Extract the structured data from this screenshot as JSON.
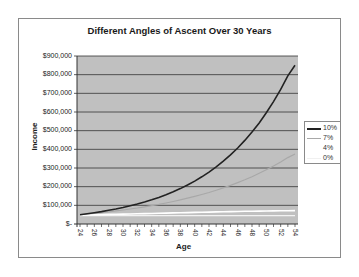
{
  "chart_data": {
    "type": "line",
    "title": "Different Angles of Ascent Over 30 Years",
    "xlabel": "Age",
    "ylabel": "Income",
    "ylim": [
      0,
      900000
    ],
    "xlim": [
      24,
      54
    ],
    "grid": true,
    "legend_position": "right",
    "y_tick_labels": [
      "$-",
      "$100,000",
      "$200,000",
      "$300,000",
      "$400,000",
      "$500,000",
      "$600,000",
      "$700,000",
      "$800,000",
      "$900,000"
    ],
    "x_tick_labels": [
      "24",
      "26",
      "28",
      "30",
      "32",
      "34",
      "36",
      "38",
      "40",
      "42",
      "44",
      "46",
      "48",
      "50",
      "52",
      "54"
    ],
    "x": [
      24,
      25,
      26,
      27,
      28,
      29,
      30,
      31,
      32,
      33,
      34,
      35,
      36,
      37,
      38,
      39,
      40,
      41,
      42,
      43,
      44,
      45,
      46,
      47,
      48,
      49,
      50,
      51,
      52,
      53,
      54
    ],
    "series": [
      {
        "name": "10%",
        "color": "#222222",
        "values": [
          50000,
          55000,
          60500,
          66550,
          73205,
          80526,
          88578,
          97436,
          107179,
          117897,
          129687,
          142656,
          156921,
          172614,
          189875,
          208862,
          229749,
          252724,
          277996,
          305795,
          336375,
          370012,
          407013,
          447715,
          492486,
          541735,
          595908,
          655499,
          721049,
          793154,
          850000
        ]
      },
      {
        "name": "7%",
        "color": "#a8a8a8",
        "values": [
          50000,
          53500,
          57245,
          61252,
          65540,
          70128,
          75036,
          80289,
          85909,
          91923,
          98358,
          105243,
          112610,
          120492,
          128927,
          137952,
          147608,
          157941,
          168997,
          180826,
          193484,
          207028,
          221520,
          237026,
          253618,
          271371,
          290367,
          310693,
          332441,
          355712,
          375000
        ]
      },
      {
        "name": "4%",
        "color": "#ffffff",
        "values": [
          48000,
          48800,
          49600,
          50400,
          51200,
          52000,
          52900,
          53800,
          54700,
          55600,
          56500,
          57400,
          58300,
          59200,
          60100,
          61000,
          61900,
          62800,
          63700,
          64600,
          65500,
          66300,
          67100,
          67800,
          68500,
          69200,
          69800,
          70400,
          71000,
          71500,
          72000
        ]
      },
      {
        "name": "0%",
        "color": "#f2f2f2",
        "values": [
          45000,
          45000,
          45000,
          45000,
          45000,
          45000,
          45000,
          45000,
          45000,
          45000,
          45000,
          45000,
          45000,
          45000,
          45000,
          45000,
          45000,
          45000,
          45000,
          45000,
          45000,
          45000,
          45000,
          45000,
          45000,
          45000,
          45000,
          45000,
          45000,
          45000,
          45000
        ]
      }
    ]
  }
}
